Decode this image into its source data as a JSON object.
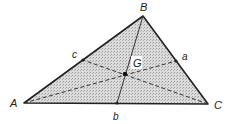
{
  "diagram": {
    "colors": {
      "fill": "#cfcfcf",
      "stroke": "#222222",
      "background": "#ffffff"
    },
    "vertices": [
      {
        "id": "A",
        "label": "A",
        "x": 24,
        "y": 103
      },
      {
        "id": "B",
        "label": "B",
        "x": 143,
        "y": 16
      },
      {
        "id": "C",
        "label": "C",
        "x": 208,
        "y": 104
      }
    ],
    "midpoints": [
      {
        "id": "a",
        "label": "a",
        "of": "BC",
        "x": 176,
        "y": 61
      },
      {
        "id": "b",
        "label": "b",
        "of": "AC",
        "x": 117,
        "y": 103
      },
      {
        "id": "c",
        "label": "c",
        "of": "AB",
        "x": 83,
        "y": 60
      }
    ],
    "centroid": {
      "id": "G",
      "label": "G",
      "x": 125,
      "y": 74
    },
    "medians": [
      {
        "from": "A",
        "to": "a",
        "style": "dashed"
      },
      {
        "from": "B",
        "to": "b",
        "style": "solid"
      },
      {
        "from": "C",
        "to": "c",
        "style": "dashed"
      }
    ]
  }
}
